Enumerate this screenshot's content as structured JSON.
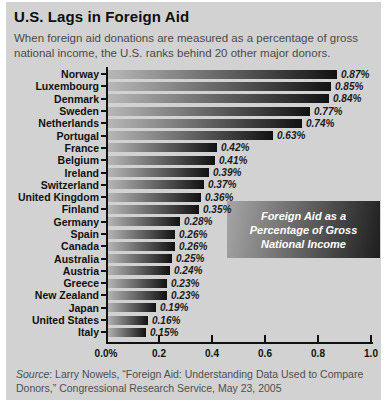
{
  "header": {
    "title": "U.S. Lags in Foreign Aid",
    "subtitle": "When foreign aid donations are measured as a percentage of gross national income, the U.S. ranks behind 20 other major donors."
  },
  "chart_data": {
    "type": "bar",
    "orientation": "horizontal",
    "title": "U.S. Lags in Foreign Aid",
    "xlabel": "",
    "ylabel": "",
    "xlim": [
      0,
      1.0
    ],
    "grid": false,
    "x_ticks": [
      {
        "label": "0.0%",
        "value": 0
      },
      {
        "label": "0.2",
        "value": 0.2
      },
      {
        "label": "0.4",
        "value": 0.4
      },
      {
        "label": "0.6",
        "value": 0.6
      },
      {
        "label": "0.8",
        "value": 0.8
      },
      {
        "label": "1.0",
        "value": 1.0
      }
    ],
    "categories": [
      "Norway",
      "Luxembourg",
      "Denmark",
      "Sweden",
      "Netherlands",
      "Portugal",
      "France",
      "Belgium",
      "Ireland",
      "Switzerland",
      "United Kingdom",
      "Finland",
      "Germany",
      "Spain",
      "Canada",
      "Australia",
      "Austria",
      "Greece",
      "New Zealand",
      "Japan",
      "United States",
      "Italy"
    ],
    "values": [
      0.87,
      0.85,
      0.84,
      0.77,
      0.74,
      0.63,
      0.42,
      0.41,
      0.39,
      0.37,
      0.36,
      0.35,
      0.28,
      0.26,
      0.26,
      0.25,
      0.24,
      0.23,
      0.23,
      0.19,
      0.16,
      0.15
    ],
    "value_labels": [
      "0.87%",
      "0.85%",
      "0.84%",
      "0.77%",
      "0.74%",
      "0.63%",
      "0.42%",
      "0.41%",
      "0.39%",
      "0.37%",
      "0.36%",
      "0.35%",
      "0.28%",
      "0.26%",
      "0.26%",
      "0.25%",
      "0.24%",
      "0.23%",
      "0.23%",
      "0.19%",
      "0.16%",
      "0.15%"
    ],
    "annotation": "Foreign Aid as a Percentage of Gross National Income"
  },
  "source": {
    "label": "Source",
    "text": ": Larry Nowels, “Foreign Aid: Understanding Data Used to Compare Donors,” Congressional Research Service, May 23, 2005"
  },
  "colors": {
    "panel_bg": "#d2d2d2",
    "bar_gradient_start": "#b9b9b9",
    "bar_gradient_end": "#121212",
    "callout_gradient_start": "#a6a6a6",
    "callout_gradient_end": "#1e1e1e",
    "axis": "#111111",
    "title_text": "#0e0e0e",
    "subtitle_text": "#4a4a4a",
    "annotation_text": "#ffffff",
    "source_text": "#4f4f4f"
  }
}
